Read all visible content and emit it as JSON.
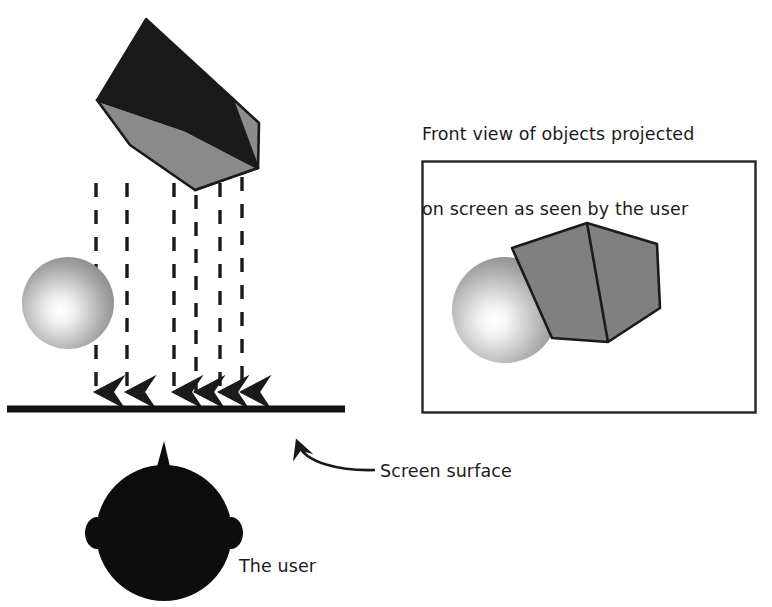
{
  "figure": {
    "type": "projection-diagram",
    "background_color": "#ffffff",
    "ink_color": "#1a1a1a"
  },
  "captions": {
    "projected_view_line1": "Front view of objects projected",
    "projected_view_line2": "on screen as seen by the user",
    "screen_surface": "Screen surface",
    "the_user": "The user"
  },
  "colors": {
    "cube_top_face": "#1a1a1a",
    "cube_side_face": "#8c8c8c",
    "cube_front_face": "#8a8a8a",
    "projected_cube_fill": "#808080",
    "sphere_light": "#fdfdfd",
    "sphere_mid": "#bdbdbd",
    "sphere_dark": "#808080",
    "head_fill": "#0d0d0d",
    "outline": "#1a1a1a",
    "panel_border": "#262626"
  },
  "scene_left": {
    "name": "side-view-scene",
    "objects": [
      {
        "name": "cube",
        "label": "3D cube above screen"
      },
      {
        "name": "sphere",
        "label": "shaded sphere above screen"
      },
      {
        "name": "screen-line",
        "label": "screen surface line"
      },
      {
        "name": "user-head",
        "label": "silhouette of user head"
      }
    ],
    "projection_rays": {
      "count": 6,
      "direction": "down",
      "style": "dashed-with-arrowhead",
      "x_positions": [
        96,
        127,
        174,
        196,
        220,
        242
      ],
      "top_y": [
        183,
        183,
        183,
        192,
        183,
        150
      ],
      "bottom_y": 398
    },
    "screen_line": {
      "x1": 7,
      "x2": 345,
      "y": 409,
      "thickness": 7
    }
  },
  "scene_right": {
    "name": "projected-view-panel",
    "panel": {
      "x": 422,
      "y": 161,
      "width": 333,
      "height": 251
    },
    "objects": [
      {
        "name": "projected-cube",
        "label": "gray hexagonal cube silhouette"
      },
      {
        "name": "projected-sphere",
        "label": "shaded sphere silhouette"
      }
    ]
  },
  "annotations": {
    "screen_surface_arrow": {
      "name": "curved-arrow",
      "from": [
        375,
        470
      ],
      "to": [
        296,
        437
      ]
    }
  }
}
